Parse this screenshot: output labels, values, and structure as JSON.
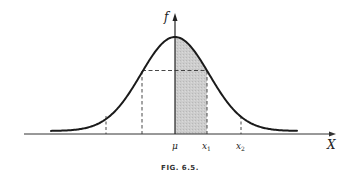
{
  "figure": {
    "caption": "FIG. 6.5.",
    "y_axis_label": "f",
    "x_axis_label": "X",
    "tick_labels": {
      "mu": "μ",
      "x1": "x",
      "x1_sub": "1",
      "x2": "x",
      "x2_sub": "2"
    }
  },
  "chart_data": {
    "type": "area",
    "title": "FIG. 6.5.",
    "xlabel": "X",
    "ylabel": "f",
    "distribution": "normal",
    "x_labels": [
      "μ",
      "x1",
      "x2"
    ],
    "shaded_region": {
      "from": "μ",
      "to": "x1"
    },
    "dashed_verticals": [
      "μ-2σ",
      "μ-σ",
      "x1 (μ+σ)",
      "x2 (μ+2σ)"
    ],
    "dashed_horizontal": "f(x1) from μ-σ to x1",
    "colors": {
      "curve": "#1a1a1a",
      "shade": "#c9c9c9",
      "axis": "#333333"
    }
  }
}
